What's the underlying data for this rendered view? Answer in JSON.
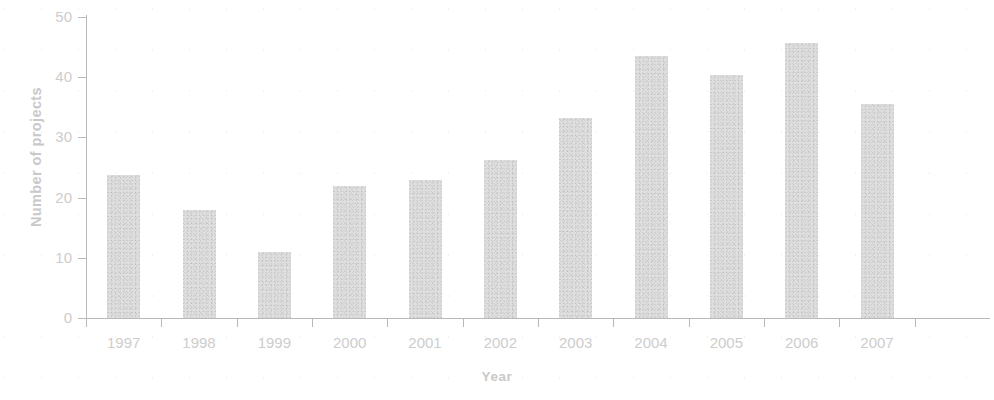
{
  "chart_data": {
    "type": "bar",
    "title": "",
    "xlabel": "Year",
    "ylabel": "Number of projects",
    "categories": [
      "1997",
      "1998",
      "1999",
      "2000",
      "2001",
      "2002",
      "2003",
      "2004",
      "2005",
      "2006",
      "2007"
    ],
    "values": [
      23.8,
      18,
      11,
      22,
      23,
      26.3,
      33.3,
      43.5,
      40.4,
      45.6,
      35.6
    ],
    "ylim": [
      0,
      50
    ],
    "yticks": [
      0,
      10,
      20,
      30,
      40,
      50
    ],
    "ytick_labels": [
      "0",
      "10",
      "20",
      "30",
      "40",
      "50"
    ],
    "grid": false,
    "legend": null,
    "bar_color": "#dededf",
    "axis_color": "#b9b9b9",
    "text_color": "#cdcdcd"
  }
}
